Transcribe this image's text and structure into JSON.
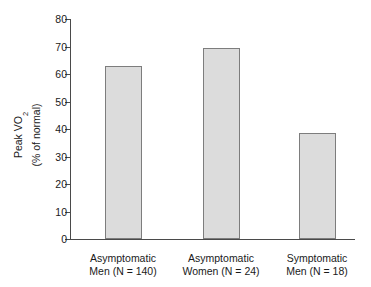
{
  "chart_data": {
    "type": "bar",
    "title": "",
    "xlabel": "",
    "ylabel": "Peak VO2 (% of normal)",
    "ylabel_line1": "Peak VO",
    "ylabel_line1_sub": "2",
    "ylabel_line2": "(% of normal)",
    "categories": [
      "Asymptomatic Men (N = 140)",
      "Asymptomatic Women (N = 24)",
      "Symptomatic Men (N = 18)"
    ],
    "category_lines": [
      {
        "line1": "Asymptomatic",
        "line2": "Men (N = 140)"
      },
      {
        "line1": "Asymptomatic",
        "line2": "Women (N = 24)"
      },
      {
        "line1": "Symptomatic",
        "line2": "Men (N = 18)"
      }
    ],
    "values": [
      63,
      69.5,
      38.5
    ],
    "ylim": [
      0,
      80
    ],
    "ytick_values": [
      0,
      10,
      20,
      30,
      40,
      50,
      60,
      70,
      80
    ],
    "ytick_labels": [
      "0",
      "10",
      "20",
      "30",
      "40",
      "50",
      "60",
      "70",
      "80"
    ],
    "grid": false,
    "legend": false,
    "legend_position": "none",
    "bar_fill_color": "#dcdcdc",
    "bar_border_color": "#7d7d7d",
    "axis_color": "#4a4a4a"
  }
}
